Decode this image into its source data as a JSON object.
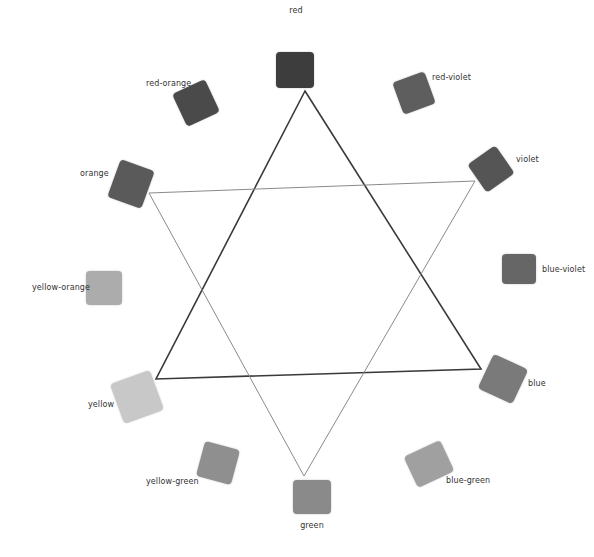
{
  "diagram": {
    "swatches": [
      {
        "name": "red",
        "label": "red",
        "color": "#3d3d3d",
        "x": 276,
        "y": 52,
        "w": 38,
        "h": 36,
        "rot": 0,
        "lx": 296,
        "ly": 6,
        "anchor": "center"
      },
      {
        "name": "red-violet",
        "label": "red-violet",
        "color": "#5e5e5e",
        "x": 397,
        "y": 76,
        "w": 34,
        "h": 34,
        "rot": -20,
        "lx": 432,
        "ly": 73,
        "anchor": "left"
      },
      {
        "name": "violet",
        "label": "violet",
        "color": "#555555",
        "x": 474,
        "y": 152,
        "w": 34,
        "h": 34,
        "rot": -35,
        "lx": 516,
        "ly": 155,
        "anchor": "left"
      },
      {
        "name": "blue-violet",
        "label": "blue-violet",
        "color": "#666666",
        "x": 502,
        "y": 254,
        "w": 34,
        "h": 30,
        "rot": 0,
        "lx": 542,
        "ly": 265,
        "anchor": "left"
      },
      {
        "name": "blue",
        "label": "blue",
        "color": "#7a7a7a",
        "x": 484,
        "y": 360,
        "w": 38,
        "h": 38,
        "rot": 25,
        "lx": 528,
        "ly": 379,
        "anchor": "left"
      },
      {
        "name": "blue-green",
        "label": "blue-green",
        "color": "#a0a0a0",
        "x": 409,
        "y": 447,
        "w": 40,
        "h": 34,
        "rot": -25,
        "lx": 446,
        "ly": 476,
        "anchor": "left"
      },
      {
        "name": "green",
        "label": "green",
        "color": "#8a8a8a",
        "x": 293,
        "y": 480,
        "w": 38,
        "h": 34,
        "rot": 0,
        "lx": 312,
        "ly": 521,
        "anchor": "center"
      },
      {
        "name": "yellow-green",
        "label": "yellow-green",
        "color": "#8f8f8f",
        "x": 200,
        "y": 445,
        "w": 36,
        "h": 36,
        "rot": 15,
        "lx": 146,
        "ly": 477,
        "anchor": "left"
      },
      {
        "name": "yellow",
        "label": "yellow",
        "color": "#c8c8c8",
        "x": 116,
        "y": 376,
        "w": 42,
        "h": 42,
        "rot": -20,
        "lx": 88,
        "ly": 400,
        "anchor": "left"
      },
      {
        "name": "yellow-orange",
        "label": "yellow-orange",
        "color": "#acacac",
        "x": 86,
        "y": 271,
        "w": 36,
        "h": 34,
        "rot": 0,
        "lx": 32,
        "ly": 283,
        "anchor": "left"
      },
      {
        "name": "orange",
        "label": "orange",
        "color": "#5a5a5a",
        "x": 113,
        "y": 164,
        "w": 36,
        "h": 40,
        "rot": 20,
        "lx": 80,
        "ly": 169,
        "anchor": "left"
      },
      {
        "name": "red-orange",
        "label": "red-orange",
        "color": "#4a4a4a",
        "x": 178,
        "y": 85,
        "w": 36,
        "h": 36,
        "rot": -25,
        "lx": 146,
        "ly": 79,
        "anchor": "left"
      }
    ],
    "triangles": [
      {
        "name": "primary-triad",
        "points": "305,91 481,369 156,379",
        "stroke": "#3a3a3a",
        "width": 1.6
      },
      {
        "name": "secondary-triad",
        "points": "149,193 475,181 304,476",
        "stroke": "#8a8a8a",
        "width": 1.0
      }
    ]
  }
}
